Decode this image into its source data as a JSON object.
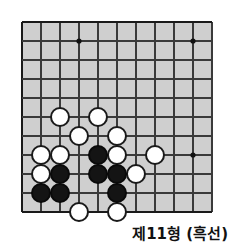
{
  "diagram": {
    "kind": "go-board-problem",
    "caption": "제11형 (흑선)",
    "board": {
      "cols": 11,
      "rows": 11,
      "origin_x": 22,
      "origin_y": 22,
      "spacing": 19,
      "background_color": "#cfcfcf",
      "line_color": "#3a3a3a",
      "edge_color": "#1a1a1a",
      "star_point_color": "#111111",
      "star_points": [
        {
          "col": 4,
          "row": 2
        },
        {
          "col": 10,
          "row": 2
        },
        {
          "col": 10,
          "row": 8
        }
      ]
    },
    "stone_radius": 10,
    "stones": [
      {
        "color": "white",
        "col": 3,
        "row": 6
      },
      {
        "color": "white",
        "col": 5,
        "row": 6
      },
      {
        "color": "white",
        "col": 4,
        "row": 7
      },
      {
        "color": "white",
        "col": 6,
        "row": 7
      },
      {
        "color": "white",
        "col": 2,
        "row": 8
      },
      {
        "color": "white",
        "col": 3,
        "row": 8
      },
      {
        "color": "white",
        "col": 6,
        "row": 8
      },
      {
        "color": "white",
        "col": 8,
        "row": 8
      },
      {
        "color": "white",
        "col": 2,
        "row": 9
      },
      {
        "color": "white",
        "col": 7,
        "row": 9
      },
      {
        "color": "white",
        "col": 4,
        "row": 11
      },
      {
        "color": "white",
        "col": 6,
        "row": 11
      },
      {
        "color": "black",
        "col": 5,
        "row": 8
      },
      {
        "color": "black",
        "col": 3,
        "row": 9
      },
      {
        "color": "black",
        "col": 5,
        "row": 9
      },
      {
        "color": "black",
        "col": 6,
        "row": 9
      },
      {
        "color": "black",
        "col": 2,
        "row": 10
      },
      {
        "color": "black",
        "col": 3,
        "row": 10
      },
      {
        "color": "black",
        "col": 6,
        "row": 10
      }
    ]
  }
}
